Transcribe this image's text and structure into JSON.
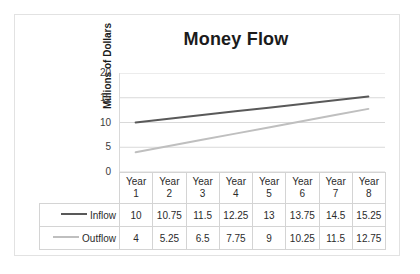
{
  "chart_data": {
    "type": "line",
    "title": "Money Flow",
    "xlabel": "",
    "ylabel": "Millions of Dollars",
    "categories": [
      "Year 1",
      "Year 2",
      "Year 3",
      "Year 4",
      "Year 5",
      "Year 6",
      "Year 7",
      "Year 8"
    ],
    "category_lines": [
      [
        "Year",
        "1"
      ],
      [
        "Year",
        "2"
      ],
      [
        "Year",
        "3"
      ],
      [
        "Year",
        "4"
      ],
      [
        "Year",
        "5"
      ],
      [
        "Year",
        "6"
      ],
      [
        "Year",
        "7"
      ],
      [
        "Year",
        "8"
      ]
    ],
    "series": [
      {
        "name": "Inflow",
        "color": "#595959",
        "values": [
          10,
          10.75,
          11.5,
          12.25,
          13,
          13.75,
          14.5,
          15.25
        ],
        "labels": [
          "10",
          "10.75",
          "11.5",
          "12.25",
          "13",
          "13.75",
          "14.5",
          "15.25"
        ]
      },
      {
        "name": "Outflow",
        "color": "#bfbfbf",
        "values": [
          4,
          5.25,
          6.5,
          7.75,
          9,
          10.25,
          11.5,
          12.75
        ],
        "labels": [
          "4",
          "5.25",
          "6.5",
          "7.75",
          "9",
          "10.25",
          "11.5",
          "12.75"
        ]
      }
    ],
    "ylim": [
      0,
      20
    ],
    "yticks": [
      0,
      5,
      10,
      15,
      20
    ],
    "ytick_labels": [
      "0",
      "5",
      "10",
      "15",
      "20"
    ],
    "grid": true,
    "grid_color": "#d9d9d9",
    "legend": "data-table",
    "has_data_table": true,
    "border_color": "#e2e2e2",
    "background": "#ffffff"
  }
}
